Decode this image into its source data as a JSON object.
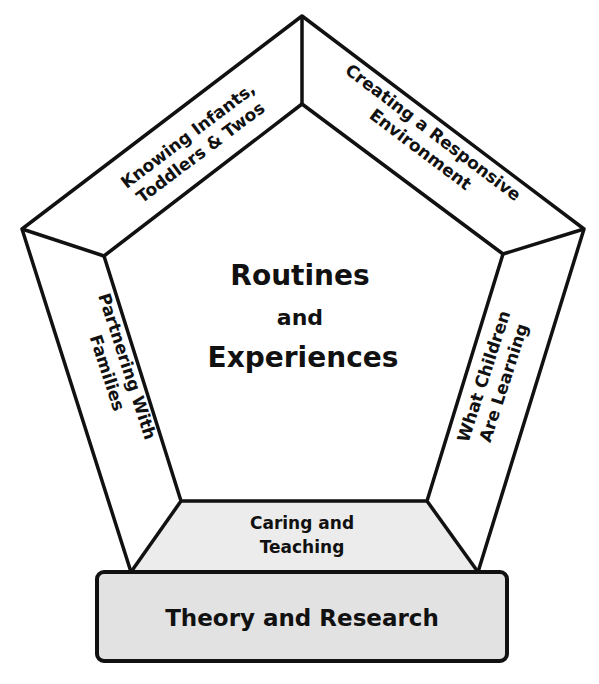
{
  "diagram": {
    "type": "pentagon-framework",
    "center": {
      "line1": "Routines",
      "line2": "and",
      "line3": "Experiences"
    },
    "sides": {
      "top_left": {
        "line1": "Knowing Infants,",
        "line2": "Toddlers & Twos"
      },
      "top_right": {
        "line1": "Creating a Responsive",
        "line2": "Environment"
      },
      "left": {
        "line1": "Partnering With",
        "line2": "Families"
      },
      "right": {
        "line1": "What Children",
        "line2": "Are Learning"
      },
      "bottom": {
        "line1": "Caring and",
        "line2": "Teaching"
      }
    },
    "base": {
      "label": "Theory and Research"
    },
    "colors": {
      "stroke": "#111111",
      "background": "#ffffff",
      "bottom_band_fill": "#ececec",
      "base_fill": "#e2e2e2"
    }
  }
}
